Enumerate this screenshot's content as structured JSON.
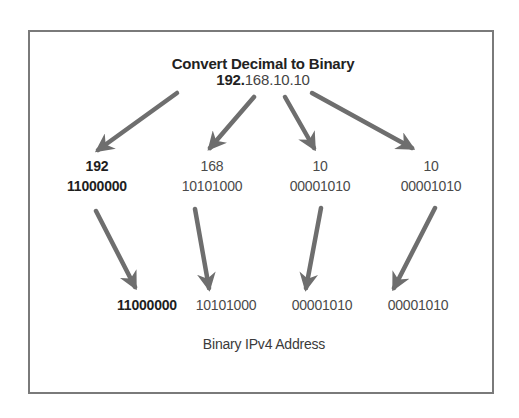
{
  "diagram": {
    "title": "Convert Decimal to Binary",
    "ip_address": {
      "full": "192.168.10.10",
      "octet_1": "192",
      "dot_1": ".",
      "octet_2": "168",
      "dot_2": ".",
      "octet_3": "10",
      "dot_3": ".",
      "octet_4": "10"
    },
    "octets": [
      {
        "decimal": "192",
        "binary": "11000000",
        "emphasis": "bold"
      },
      {
        "decimal": "168",
        "binary": "10101000",
        "emphasis": "normal"
      },
      {
        "decimal": "10",
        "binary": "00001010",
        "emphasis": "normal"
      },
      {
        "decimal": "10",
        "binary": "00001010",
        "emphasis": "normal"
      }
    ],
    "binary_result": [
      "11000000",
      "10101000",
      "00001010",
      "00001010"
    ],
    "caption": "Binary IPv4 Address",
    "colors": {
      "arrow": "#6e6e6e",
      "frame": "#7a7a7a",
      "text_dark": "#222222",
      "text_regular": "#444444"
    }
  }
}
